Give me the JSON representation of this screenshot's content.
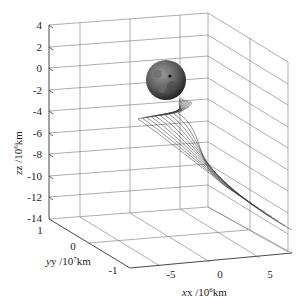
{
  "chart_data": {
    "type": "line",
    "subtype": "3d-trajectory",
    "title": "",
    "xlabel": "x /10^6km",
    "ylabel": "y /10^7km",
    "zlabel": "z /10^6km",
    "x_ticks": [
      "-5",
      "0",
      "5"
    ],
    "y_ticks": [
      "1",
      "0",
      "-1"
    ],
    "z_ticks": [
      "4",
      "2",
      "0",
      "-2",
      "-4",
      "-6",
      "-8",
      "-10",
      "-12",
      "-14"
    ],
    "xlim": [
      -8,
      7
    ],
    "ylim": [
      -1.2,
      1
    ],
    "zlim": [
      -14,
      4
    ],
    "grid": true,
    "annotations": [
      "Moon sphere at origin region",
      "bundle of ~10 transfer trajectories"
    ],
    "series": [
      {
        "name": "trajectory bundle",
        "count": 10,
        "start_region": "near Moon (x≈0, z≈0)",
        "end_region": "x≈6, z≈-10"
      }
    ]
  },
  "labels": {
    "z_axis": "z /10",
    "z_exp": "6",
    "z_unit": "km",
    "y_axis": "y /10",
    "y_exp": "7",
    "y_unit": "km",
    "x_axis": "x /10",
    "x_exp": "6",
    "x_unit": "km"
  }
}
